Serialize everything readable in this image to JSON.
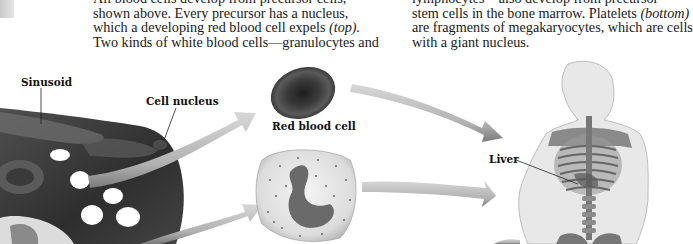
{
  "text": {
    "left_column": [
      {
        "text": "All blood cells develop from precursor cells,"
      },
      {
        "text": "shown above. Every precursor has a nucleus,"
      },
      {
        "text": "which a developing red blood cell expels ",
        "italic": "(top)."
      },
      {
        "text": "Two kinds of white blood cells—granulocytes and"
      }
    ],
    "right_column": [
      {
        "text": "lymphocytes—also develop from precursor"
      },
      {
        "text": "stem cells in the bone marrow. Platelets ",
        "italic": "(bottom)"
      },
      {
        "text": "are fragments of megakaryocytes, which are cells"
      },
      {
        "text": "with a giant nucleus."
      }
    ]
  },
  "labels": {
    "sinusoid": "Sinusoid",
    "cell_nucleus": "Cell nucleus",
    "red_blood_cell": "Red blood cell",
    "liver": "Liver"
  },
  "illustration": {
    "marrow": "bone-marrow-sinusoid-illustration",
    "rbc": "red-blood-cell-illustration",
    "wbc": "granulocyte-white-blood-cell-illustration",
    "body": "human-torso-skeleton-illustration",
    "arrows": "flow-arrows"
  }
}
